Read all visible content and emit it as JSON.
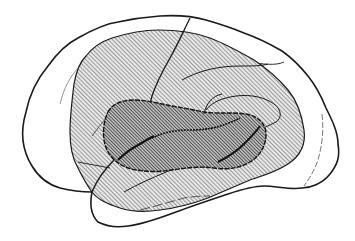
{
  "figure": {
    "width": 355,
    "height": 241,
    "regions": [
      {
        "name": "outer-cortex-outline",
        "fill": "none"
      },
      {
        "name": "outer-hatched-region",
        "fill": "light-hatch"
      },
      {
        "name": "inner-hatched-region",
        "fill": "dense-hatch"
      }
    ],
    "colors": {
      "background": "#ffffff",
      "stroke": "#1a1a1a",
      "hatch_light": "#555555",
      "hatch_dense": "#222222",
      "light_fill": "#e4e4e4",
      "dense_fill": "#bdbdbd"
    }
  }
}
